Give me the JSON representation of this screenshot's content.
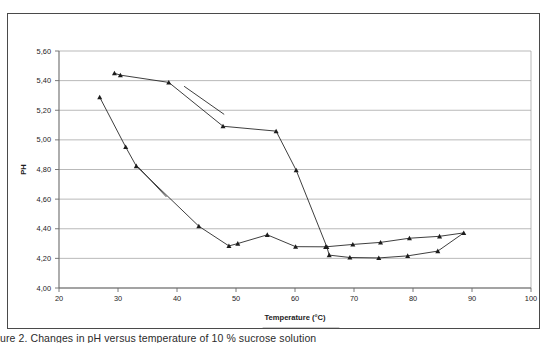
{
  "figure": {
    "caption": "ure 2. Changes in pH versus temperature of 10 % sucrose solution"
  },
  "chart_data": {
    "type": "line",
    "title": "",
    "xlabel": "Temperature (°C)",
    "ylabel": "PH",
    "xlim": [
      20,
      100
    ],
    "ylim": [
      4.0,
      5.6
    ],
    "xticks": [
      20,
      30,
      40,
      50,
      60,
      70,
      80,
      90,
      100
    ],
    "xtick_labels": [
      "20",
      "30",
      "40",
      "50",
      "60",
      "70",
      "80",
      "90",
      "100"
    ],
    "yticks": [
      4.0,
      4.2,
      4.4,
      4.6,
      4.8,
      5.0,
      5.2,
      5.4,
      5.6
    ],
    "ytick_labels": [
      "4,00",
      "4,20",
      "4,40",
      "4,60",
      "4,80",
      "5,00",
      "5,20",
      "5,40",
      "5,60"
    ],
    "grid": "horizontal",
    "legend_position": "bottom-center",
    "marker": "triangle",
    "line_color": "#1c1c1c",
    "series": [
      {
        "name": "PH cycle 1",
        "points": [
          [
            29.4,
            5.45
          ],
          [
            30.4,
            5.437
          ],
          [
            38.6,
            5.388
          ],
          [
            47.8,
            5.092
          ],
          [
            56.8,
            5.059
          ],
          [
            60.2,
            4.795
          ],
          [
            65.4,
            4.277
          ],
          [
            65.8,
            4.222
          ],
          [
            69.3,
            4.206
          ],
          [
            74.2,
            4.203
          ],
          [
            79.1,
            4.217
          ],
          [
            84.2,
            4.249
          ],
          [
            88.6,
            4.372
          ],
          [
            84.5,
            4.349
          ],
          [
            79.4,
            4.336
          ],
          [
            74.5,
            4.308
          ],
          [
            69.8,
            4.294
          ],
          [
            65.2,
            4.278
          ],
          [
            60.1,
            4.279
          ],
          [
            55.3,
            4.359
          ],
          [
            50.3,
            4.3
          ],
          [
            48.8,
            4.284
          ],
          [
            43.7,
            4.417
          ],
          [
            33.1,
            4.823
          ],
          [
            31.3,
            4.952
          ],
          [
            26.9,
            5.288
          ]
        ]
      },
      {
        "name": "segment-upper-tail",
        "points": [
          [
            41.2,
            5.362
          ],
          [
            48.0,
            5.172
          ]
        ]
      },
      {
        "name": "segment-lower-tail",
        "points": [
          [
            33.4,
            4.818
          ],
          [
            38.2,
            4.615
          ]
        ]
      }
    ],
    "legend": [
      {
        "label": "PH cycle 1"
      }
    ]
  }
}
